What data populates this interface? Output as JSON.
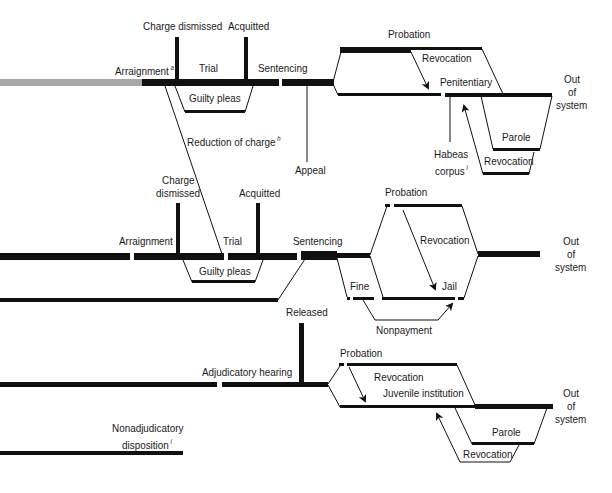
{
  "colors": {
    "line": "#111111",
    "gray_line": "#a8a8a8",
    "background": "#ffffff"
  },
  "row1": {
    "arraignment": "Arraignment",
    "arraignment_note": "a",
    "charge_dismissed": "Charge dismissed",
    "acquitted": "Acquitted",
    "trial": "Trial",
    "sentencing": "Sentencing",
    "guilty_pleas": "Guilty pleas",
    "reduction_of_charge": "Reduction of charge",
    "reduction_note": "h",
    "appeal": "Appeal",
    "probation": "Probation",
    "revocation_probation": "Revocation",
    "penitentiary": "Penitentiary",
    "habeas_1": "Habeas",
    "habeas_2": "corpus",
    "habeas_note": "i",
    "parole": "Parole",
    "revocation_parole": "Revocation",
    "out_1": "Out",
    "out_2": "of",
    "out_3": "system"
  },
  "row2": {
    "arraignment": "Arraignment",
    "charge_dismissed_1": "Charge",
    "charge_dismissed_2": "dismissed",
    "acquitted": "Acquitted",
    "trial": "Trial",
    "sentencing": "Sentencing",
    "guilty_pleas": "Guilty pleas",
    "probation": "Probation",
    "revocation": "Revocation",
    "fine": "Fine",
    "jail": "Jail",
    "nonpayment": "Nonpayment",
    "out_1": "Out",
    "out_2": "of",
    "out_3": "system"
  },
  "row3": {
    "released": "Released",
    "adjudicatory_hearing": "Adjudicatory hearing",
    "probation": "Probation",
    "revocation_probation": "Revocation",
    "juvenile_institution": "Juvenile institution",
    "parole": "Parole",
    "revocation_parole": "Revocation",
    "nonadjudicatory_1": "Nonadjudicatory",
    "nonadjudicatory_2": "disposition",
    "nonadjudicatory_note": "i",
    "out_1": "Out",
    "out_2": "of",
    "out_3": "system"
  }
}
